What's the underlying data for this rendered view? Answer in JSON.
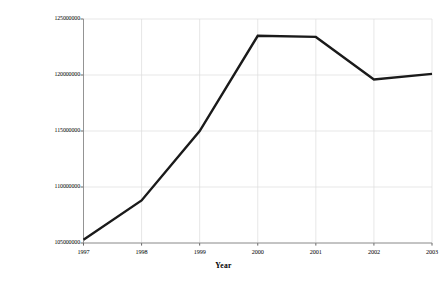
{
  "chart_data": {
    "type": "line",
    "title": "",
    "xlabel": "Year",
    "ylabel": "Mean Overnight Stays in the\nHotel Market",
    "categories": [
      "1997",
      "1998",
      "1999",
      "2000",
      "2001",
      "2002",
      "2003"
    ],
    "x": [
      1997,
      1998,
      1999,
      2000,
      2001,
      2002,
      2003
    ],
    "values": [
      105300000,
      108800000,
      115000000,
      123500000,
      123400000,
      119600000,
      120100000
    ],
    "series": [
      {
        "name": "Mean Overnight Stays in the Hotel Market",
        "values": [
          105300000,
          108800000,
          115000000,
          123500000,
          123400000,
          119600000,
          120100000
        ]
      }
    ],
    "ylim": [
      105000000,
      125000000
    ],
    "xlim": [
      1997,
      2003
    ],
    "yticks": [
      105000000,
      110000000,
      115000000,
      120000000,
      125000000
    ],
    "ytick_labels": [
      "105000000",
      "110000000",
      "115000000",
      "120000000",
      "125000000"
    ],
    "xticks": [
      1997,
      1998,
      1999,
      2000,
      2001,
      2002,
      2003
    ],
    "xtick_labels": [
      "1997",
      "1998",
      "1999",
      "2000",
      "2001",
      "2002",
      "2003"
    ],
    "grid": true,
    "grid_color": "#dcdcdc",
    "legend": false,
    "legend_position": "none",
    "line_color": "#1a1a1a",
    "line_width": 2.4,
    "axis_color": "#8a8a8a",
    "background_color": "#ffffff"
  },
  "axes": {
    "y_title": "Mean Overnight Stays in the\nHotel Market",
    "x_title": "Year"
  }
}
